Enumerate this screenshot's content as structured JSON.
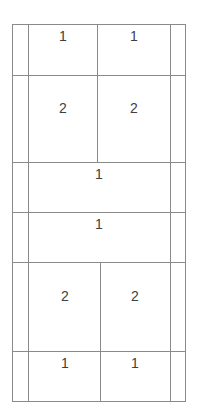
{
  "table": {
    "rows": [
      {
        "cells": [
          "1",
          "1"
        ]
      },
      {
        "cells": [
          "2",
          "2"
        ]
      },
      {
        "cells": [
          "1"
        ]
      },
      {
        "cells": [
          "1"
        ]
      },
      {
        "cells": [
          "2",
          "2"
        ]
      },
      {
        "cells": [
          "1",
          "1"
        ]
      }
    ],
    "border_color": "#8a8a8a",
    "text_color": "#404040"
  }
}
